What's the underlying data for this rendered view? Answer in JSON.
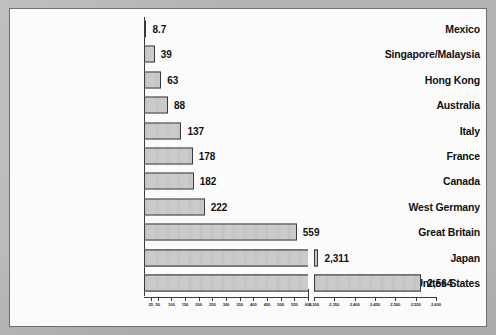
{
  "chart_data": {
    "type": "bar",
    "orientation": "horizontal",
    "title": "",
    "subtitle": "",
    "xlabel": "",
    "ylabel": "",
    "legend": [],
    "grid": false,
    "broken_axis": true,
    "axis_segments": [
      {
        "name": "lower",
        "range": [
          0,
          600
        ],
        "ticks": [
          25,
          50,
          100,
          150,
          200,
          250,
          300,
          350,
          400,
          450,
          500,
          550,
          600
        ],
        "tick_labels": [
          "25",
          "50",
          "100",
          "150",
          "200",
          "250",
          "300",
          "350",
          "400",
          "450",
          "500",
          "550",
          "600"
        ]
      },
      {
        "name": "upper",
        "range": [
          2300,
          2600
        ],
        "ticks": [
          2300,
          2350,
          2400,
          2450,
          2500,
          2550,
          2600
        ],
        "tick_labels": [
          "2,300",
          "2,350",
          "2,400",
          "2,450",
          "2,500",
          "2,550",
          "2,600"
        ]
      }
    ],
    "categories": [
      "Mexico",
      "Singapore/Malaysia",
      "Hong Kong",
      "Australia",
      "Italy",
      "France",
      "Canada",
      "West Germany",
      "Great Britain",
      "Japan",
      "Unites States"
    ],
    "values": [
      8.7,
      39,
      63,
      88,
      137,
      178,
      182,
      222,
      559,
      2311,
      2564
    ],
    "value_labels": [
      "8.7",
      "39",
      "63",
      "88",
      "137",
      "178",
      "182",
      "222",
      "559",
      "2,311",
      "2,564"
    ],
    "colors": {
      "bar_fill": "#c9c9c9",
      "bar_stroke": "#3a3a3a",
      "text": "#111111",
      "panel_background": "#fbfbfb",
      "page_background": "#b3b3b3",
      "panel_border": "#6e6e6e"
    }
  }
}
